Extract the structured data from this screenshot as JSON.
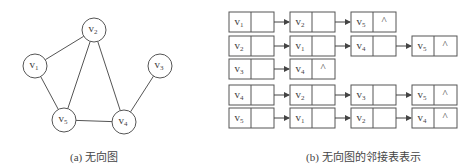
{
  "graph": {
    "caption": "(a) 无向图",
    "nodes": [
      {
        "id": "v1",
        "label": "v",
        "sub": "1",
        "x": 35,
        "y": 66
      },
      {
        "id": "v2",
        "label": "v",
        "sub": "2",
        "x": 94,
        "y": 30
      },
      {
        "id": "v3",
        "label": "v",
        "sub": "3",
        "x": 160,
        "y": 66
      },
      {
        "id": "v4",
        "label": "v",
        "sub": "4",
        "x": 124,
        "y": 122
      },
      {
        "id": "v5",
        "label": "v",
        "sub": "5",
        "x": 64,
        "y": 120
      }
    ],
    "edges": [
      [
        "v1",
        "v2"
      ],
      [
        "v1",
        "v5"
      ],
      [
        "v2",
        "v5"
      ],
      [
        "v2",
        "v4"
      ],
      [
        "v5",
        "v4"
      ],
      [
        "v3",
        "v4"
      ]
    ]
  },
  "adjacency_list": {
    "caption": "(b) 无向图的邻接表表示",
    "null_symbol": "^",
    "rows": [
      {
        "head": "1",
        "list": [
          "2",
          "5"
        ]
      },
      {
        "head": "2",
        "list": [
          "1",
          "4",
          "5"
        ]
      },
      {
        "head": "3",
        "list": [
          "4"
        ]
      },
      {
        "head": "4",
        "list": [
          "2",
          "3",
          "5"
        ]
      },
      {
        "head": "5",
        "list": [
          "1",
          "2",
          "4"
        ]
      }
    ]
  }
}
